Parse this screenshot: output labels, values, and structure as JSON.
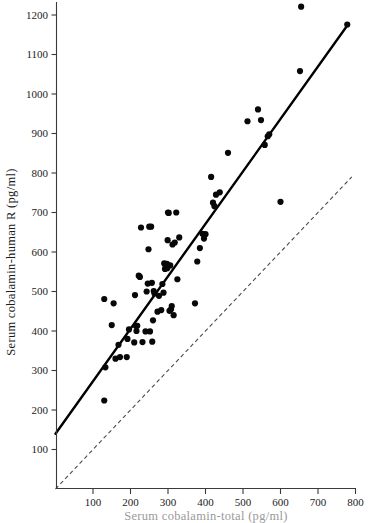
{
  "chart_data": {
    "type": "scatter",
    "title": "",
    "subtitle": "",
    "xlabel": "Serum cobalamin-total (pg/ml)",
    "ylabel": "Serum cobalamin-human R (pg/ml)",
    "xlim": [
      0,
      820
    ],
    "ylim": [
      0,
      1245
    ],
    "xticks": [
      100,
      200,
      300,
      400,
      500,
      600,
      700,
      800
    ],
    "xtick_labels": [
      "100",
      "200",
      "300",
      "400",
      "500",
      "600",
      "700",
      "800"
    ],
    "yticks": [
      100,
      200,
      300,
      400,
      500,
      600,
      700,
      800,
      900,
      1000,
      1100,
      1200
    ],
    "ytick_labels": [
      "100",
      "200",
      "300",
      "400",
      "500",
      "600",
      "700",
      "800",
      "900",
      "1000",
      "1100",
      "1200"
    ],
    "grid": false,
    "legend": "none",
    "marker": "filled-circle",
    "marker_size_px": 3.1,
    "series": [
      {
        "name": "Subjects",
        "type": "scatter",
        "color": "#080808",
        "points": [
          [
            130,
            224
          ],
          [
            130,
            481
          ],
          [
            133,
            308
          ],
          [
            150,
            415
          ],
          [
            155,
            470
          ],
          [
            160,
            330
          ],
          [
            168,
            365
          ],
          [
            172,
            334
          ],
          [
            190,
            334
          ],
          [
            192,
            380
          ],
          [
            196,
            404
          ],
          [
            210,
            371
          ],
          [
            212,
            491
          ],
          [
            214,
            413
          ],
          [
            216,
            400
          ],
          [
            218,
            413
          ],
          [
            222,
            540
          ],
          [
            225,
            537
          ],
          [
            228,
            662
          ],
          [
            232,
            372
          ],
          [
            240,
            399
          ],
          [
            243,
            500
          ],
          [
            246,
            520
          ],
          [
            248,
            607
          ],
          [
            250,
            664
          ],
          [
            252,
            399
          ],
          [
            255,
            664
          ],
          [
            257,
            522
          ],
          [
            258,
            373
          ],
          [
            260,
            427
          ],
          [
            262,
            501
          ],
          [
            264,
            495
          ],
          [
            272,
            449
          ],
          [
            276,
            489
          ],
          [
            282,
            453
          ],
          [
            285,
            519
          ],
          [
            288,
            497
          ],
          [
            290,
            571
          ],
          [
            292,
            557
          ],
          [
            294,
            565
          ],
          [
            296,
            562
          ],
          [
            297,
            570
          ],
          [
            298,
            559
          ],
          [
            299,
            630
          ],
          [
            300,
            700
          ],
          [
            302,
            699
          ],
          [
            304,
            451
          ],
          [
            306,
            566
          ],
          [
            308,
            455
          ],
          [
            310,
            463
          ],
          [
            312,
            619
          ],
          [
            315,
            440
          ],
          [
            318,
            624
          ],
          [
            322,
            700
          ],
          [
            325,
            531
          ],
          [
            330,
            637
          ],
          [
            372,
            470
          ],
          [
            378,
            576
          ],
          [
            385,
            610
          ],
          [
            392,
            646
          ],
          [
            396,
            634
          ],
          [
            400,
            645
          ],
          [
            415,
            790
          ],
          [
            420,
            725
          ],
          [
            424,
            716
          ],
          [
            428,
            745
          ],
          [
            438,
            751
          ],
          [
            460,
            851
          ],
          [
            512,
            931
          ],
          [
            540,
            961
          ],
          [
            548,
            934
          ],
          [
            558,
            871
          ],
          [
            566,
            893
          ],
          [
            570,
            898
          ],
          [
            600,
            727
          ],
          [
            652,
            1058
          ],
          [
            655,
            1221
          ],
          [
            778,
            1176
          ]
        ]
      }
    ],
    "lines": [
      {
        "name": "regression-line",
        "style": "solid",
        "color": "#000000",
        "x0": 0,
        "y0": 140,
        "x1": 780,
        "y1": 1176
      },
      {
        "name": "identity-line",
        "style": "dashed",
        "color": "#4a4a4a",
        "x0": 0,
        "y0": 0,
        "x1": 790,
        "y1": 790
      }
    ]
  }
}
